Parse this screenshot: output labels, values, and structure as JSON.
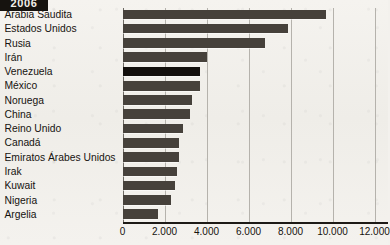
{
  "badge": {
    "year": "2006"
  },
  "chart_data": {
    "type": "bar",
    "orientation": "horizontal",
    "title": "2006",
    "xlabel": "",
    "ylabel": "",
    "xlim": [
      0,
      12000
    ],
    "grid": true,
    "legend": "none",
    "tick_labels": [
      "0",
      "2.000",
      "4.000",
      "6.000",
      "8.000",
      "10.000",
      "12.000"
    ],
    "tick_values": [
      0,
      2000,
      4000,
      6000,
      8000,
      10000,
      12000
    ],
    "highlight_category": "Venezuela",
    "colors": {
      "bar": "#46413b",
      "bar_highlight": "#120f0c",
      "background": "#f3f1ed",
      "gridline": "#b5b2ac",
      "axis": "#1d1a16",
      "text": "#16130f",
      "badge_background": "#16130f",
      "badge_text": "#f2efe9"
    },
    "categories": [
      "Arabia Saudita",
      "Estados Unidos",
      "Rusia",
      "Irán",
      "Venezuela",
      "México",
      "Noruega",
      "China",
      "Reino Unido",
      "Canadá",
      "Emiratos Árabes Unidos",
      "Irak",
      "Kuwait",
      "Nigeria",
      "Argelia"
    ],
    "values": [
      9700,
      7900,
      6800,
      4000,
      3700,
      3700,
      3300,
      3200,
      2900,
      2700,
      2700,
      2600,
      2500,
      2300,
      1700
    ]
  }
}
